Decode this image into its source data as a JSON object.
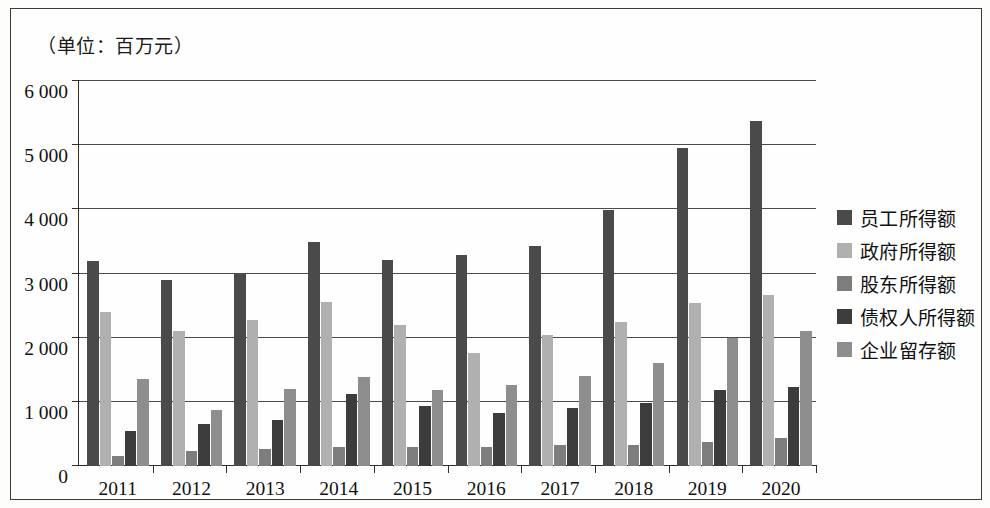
{
  "unit_note": "（单位：百万元）",
  "legend": {
    "items": [
      {
        "label": "员工所得额",
        "color": "#4a4a4a"
      },
      {
        "label": "政府所得额",
        "color": "#b0b0b0"
      },
      {
        "label": "股东所得额",
        "color": "#7d7d7d"
      },
      {
        "label": "债权人所得额",
        "color": "#3c3c3c"
      },
      {
        "label": "企业留存额",
        "color": "#8e8e8e"
      }
    ]
  },
  "axis": {
    "y_ticks": [
      "0",
      "1 000",
      "2 000",
      "3 000",
      "4 000",
      "5 000",
      "6 000"
    ],
    "x_ticks": [
      "2011",
      "2012",
      "2013",
      "2014",
      "2015",
      "2016",
      "2017",
      "2018",
      "2019",
      "2020"
    ]
  },
  "chart_data": {
    "type": "bar",
    "title": "（单位：百万元）",
    "xlabel": "",
    "ylabel": "百万元",
    "ylim": [
      0,
      6000
    ],
    "ytick_interval": 1000,
    "grid": true,
    "legend_position": "right",
    "categories": [
      "2011",
      "2012",
      "2013",
      "2014",
      "2015",
      "2016",
      "2017",
      "2018",
      "2019",
      "2020"
    ],
    "series": [
      {
        "name": "员工所得额",
        "color": "#4a4a4a",
        "values": [
          3200,
          2900,
          3010,
          3490,
          3210,
          3290,
          3430,
          3990,
          4960,
          5380
        ]
      },
      {
        "name": "政府所得额",
        "color": "#b0b0b0",
        "values": [
          2400,
          2110,
          2280,
          2560,
          2200,
          1760,
          2040,
          2250,
          2540,
          2660
        ]
      },
      {
        "name": "股东所得额",
        "color": "#7d7d7d",
        "values": [
          150,
          240,
          270,
          300,
          290,
          290,
          320,
          330,
          380,
          440
        ]
      },
      {
        "name": "债权人所得额",
        "color": "#3c3c3c",
        "values": [
          550,
          650,
          710,
          1130,
          940,
          830,
          900,
          980,
          1190,
          1230
        ]
      },
      {
        "name": "企业留存额",
        "color": "#8e8e8e",
        "values": [
          1350,
          880,
          1200,
          1380,
          1190,
          1270,
          1400,
          1610,
          1990,
          2110
        ]
      }
    ]
  }
}
